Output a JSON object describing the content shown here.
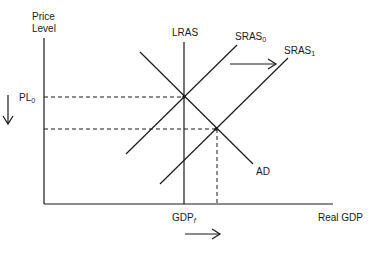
{
  "diagram": {
    "type": "AD-AS model",
    "y_axis_label_line1": "Price",
    "y_axis_label_line2": "Level",
    "x_axis_label": "Real GDP",
    "price_level_label": "PL",
    "price_level_sub": "0",
    "gdp_label": "GDP",
    "gdp_sub": "f",
    "curves": {
      "lras": "LRAS",
      "sras0": "SRAS",
      "sras0_sub": "0",
      "sras1": "SRAS",
      "sras1_sub": "1",
      "ad": "AD"
    },
    "annotations": {
      "sras_shift": "right",
      "price_change": "down",
      "gdp_change": "right"
    }
  }
}
